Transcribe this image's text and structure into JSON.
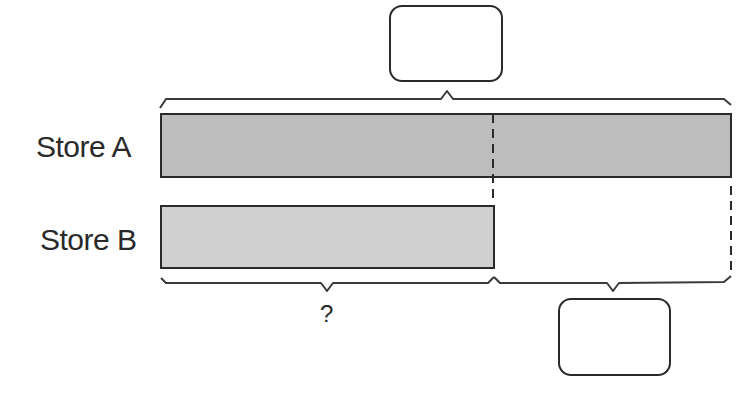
{
  "diagram": {
    "type": "tape-diagram",
    "rows": [
      {
        "label": "Store A",
        "relative_length": 1.0,
        "fill": "#bdbdbd"
      },
      {
        "label": "Store B",
        "relative_length": 0.584,
        "fill": "#d0d0d0"
      }
    ],
    "braces": {
      "top_total": {
        "spans": "Store A",
        "answer_box": ""
      },
      "bottom_store_b": {
        "spans": "Store B",
        "label": "?"
      },
      "bottom_difference": {
        "spans": "Store A minus Store B",
        "answer_box": ""
      }
    },
    "colors": {
      "stroke": "#2a2a2a",
      "store_a_fill": "#bdbdbd",
      "store_b_fill": "#d0d0d0"
    }
  }
}
